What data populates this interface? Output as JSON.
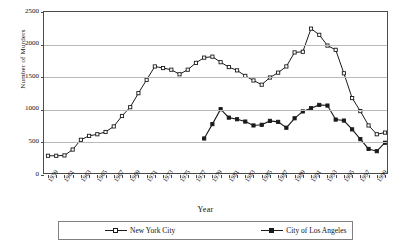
{
  "chart_data": {
    "type": "line",
    "title": "",
    "xlabel": "Year",
    "ylabel": "Number of Murders",
    "ylim": [
      0,
      2500
    ],
    "yticks": [
      0,
      500,
      1000,
      1500,
      2000,
      2500
    ],
    "grid": true,
    "legend_position": "bottom",
    "x": [
      1959,
      1960,
      1961,
      1962,
      1963,
      1964,
      1965,
      1966,
      1967,
      1968,
      1969,
      1970,
      1971,
      1972,
      1973,
      1974,
      1975,
      1976,
      1977,
      1978,
      1979,
      1980,
      1981,
      1982,
      1983,
      1984,
      1985,
      1986,
      1987,
      1988,
      1989,
      1990,
      1991,
      1992,
      1993,
      1994,
      1995,
      1996,
      1997,
      1998,
      1999,
      2000
    ],
    "xtick_labels": [
      "1959",
      "1961",
      "1963",
      "1965",
      "1967",
      "1969",
      "1971",
      "1973",
      "1975",
      "1977",
      "1979",
      "1981",
      "1983",
      "1985",
      "1987",
      "1989",
      "1991",
      "1993",
      "1995",
      "1997",
      "1999"
    ],
    "series": [
      {
        "name": "New York City",
        "marker": "open-square",
        "color": "#1a1a1a",
        "values": [
          295,
          295,
          300,
          390,
          540,
          600,
          625,
          660,
          745,
          905,
          1040,
          1255,
          1460,
          1665,
          1640,
          1615,
          1545,
          1615,
          1720,
          1800,
          1815,
          1730,
          1655,
          1605,
          1520,
          1450,
          1385,
          1495,
          1570,
          1665,
          1880,
          1890,
          2245,
          2150,
          1985,
          1920,
          1560,
          1180,
          980,
          760,
          625,
          650
        ]
      },
      {
        "name": "City of Los Angeles",
        "marker": "filled-square",
        "color": "#1a1a1a",
        "values": [
          null,
          null,
          null,
          null,
          null,
          null,
          null,
          null,
          null,
          null,
          null,
          null,
          null,
          null,
          null,
          null,
          null,
          null,
          null,
          560,
          780,
          1010,
          880,
          855,
          820,
          760,
          770,
          830,
          815,
          725,
          870,
          975,
          1025,
          1075,
          1065,
          850,
          835,
          700,
          550,
          400,
          365,
          495
        ]
      }
    ]
  },
  "axis": {
    "y_title": "Number of Murders",
    "x_title": "Year",
    "y_tick_labels": [
      "2500",
      "2000",
      "1500",
      "1000",
      "500",
      "0"
    ]
  },
  "legend": {
    "items": [
      {
        "label": "New York City",
        "marker": "open-square"
      },
      {
        "label": "City of Los Angeles",
        "marker": "filled-square"
      }
    ]
  }
}
